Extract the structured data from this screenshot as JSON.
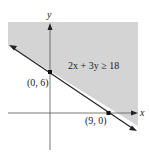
{
  "diagram": {
    "axes": {
      "x_label": "x",
      "y_label": "y"
    },
    "inequality": "2x + 3y ≥ 18",
    "points": [
      {
        "label": "(0, 6)",
        "x": 0,
        "y": 6
      },
      {
        "label": "(9, 0)",
        "x": 9,
        "y": 0
      }
    ],
    "colors": {
      "shade": "#d4d4d4",
      "line": "#222222",
      "axis": "#444444"
    }
  }
}
